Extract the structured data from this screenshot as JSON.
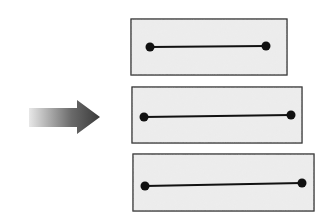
{
  "diagram": {
    "arrow": {
      "direction": "right",
      "gradient_start": "#e8e8e8",
      "gradient_end": "#3a3a3a"
    },
    "panels": [
      {
        "x": 131,
        "y": 19,
        "w": 156,
        "h": 56,
        "p1": [
          150,
          47
        ],
        "p2": [
          266,
          46
        ]
      },
      {
        "x": 132,
        "y": 87,
        "w": 170,
        "h": 56,
        "p1": [
          144,
          117
        ],
        "p2": [
          291,
          115
        ]
      },
      {
        "x": 133,
        "y": 154,
        "w": 181,
        "h": 57,
        "p1": [
          145,
          186
        ],
        "p2": [
          302,
          183
        ]
      }
    ],
    "colors": {
      "panel_fill": "#ececec",
      "panel_stroke": "#2a2a2a",
      "segment": "#111111"
    }
  }
}
